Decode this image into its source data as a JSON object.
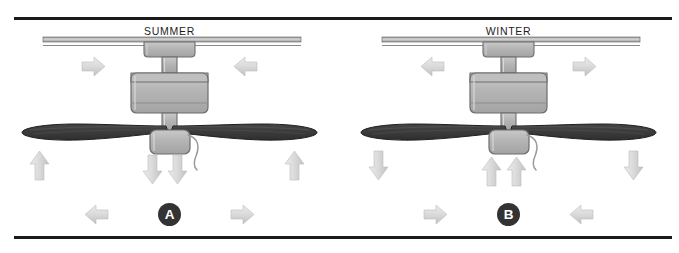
{
  "figure": {
    "kind": "ceiling-fan-seasonal-direction-diagram",
    "background_color": "#ffffff",
    "rule_color": "#1a1a1a"
  },
  "panels": [
    {
      "id": "summer",
      "title": "SUMMER",
      "badge_label": "A",
      "badge_color": "#333333",
      "badge_text_color": "#ffffff",
      "blade_color": "#3a3a3a",
      "housing_color": "#b4b4b4",
      "arrow_color": "#d6d6d6",
      "airflow": {
        "ceiling_arrows": [
          "right",
          "left"
        ],
        "side_arrows": [
          "up",
          "up"
        ],
        "center_arrows": [
          "down",
          "down"
        ],
        "floor_arrows": [
          "left",
          "right"
        ]
      },
      "arrows": [
        {
          "name": "ceiling-left-arrow",
          "dir": "right"
        },
        {
          "name": "ceiling-right-arrow",
          "dir": "left"
        },
        {
          "name": "side-left-arrow",
          "dir": "up"
        },
        {
          "name": "side-right-arrow",
          "dir": "up"
        },
        {
          "name": "center-left-arrow",
          "dir": "down"
        },
        {
          "name": "center-right-arrow",
          "dir": "down"
        },
        {
          "name": "floor-left-arrow",
          "dir": "left"
        },
        {
          "name": "floor-right-arrow",
          "dir": "right"
        }
      ]
    },
    {
      "id": "winter",
      "title": "WINTER",
      "badge_label": "B",
      "badge_color": "#333333",
      "badge_text_color": "#ffffff",
      "blade_color": "#3a3a3a",
      "housing_color": "#b4b4b4",
      "arrow_color": "#d6d6d6",
      "airflow": {
        "ceiling_arrows": [
          "left",
          "right"
        ],
        "side_arrows": [
          "down",
          "down"
        ],
        "center_arrows": [
          "up",
          "up"
        ],
        "floor_arrows": [
          "right",
          "left"
        ]
      },
      "arrows": [
        {
          "name": "ceiling-left-arrow",
          "dir": "left"
        },
        {
          "name": "ceiling-right-arrow",
          "dir": "right"
        },
        {
          "name": "side-left-arrow",
          "dir": "down"
        },
        {
          "name": "side-right-arrow",
          "dir": "down"
        },
        {
          "name": "center-left-arrow",
          "dir": "up"
        },
        {
          "name": "center-right-arrow",
          "dir": "up"
        },
        {
          "name": "floor-left-arrow",
          "dir": "right"
        },
        {
          "name": "floor-right-arrow",
          "dir": "left"
        }
      ]
    }
  ]
}
